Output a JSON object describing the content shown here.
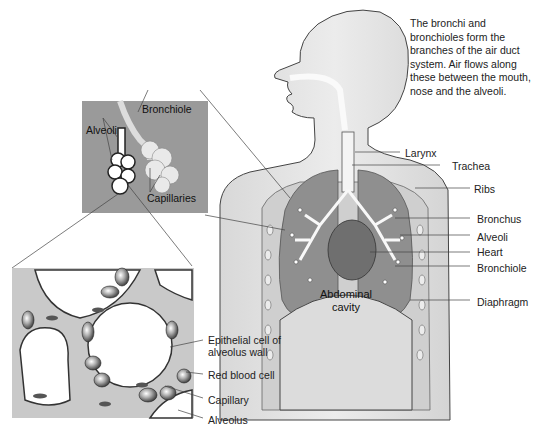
{
  "description": "The bronchi and bronchioles form the branches of the air duct system. Air flows along these between the mouth, nose and the alveoli.",
  "body_labels": {
    "larynx": "Larynx",
    "trachea": "Trachea",
    "ribs": "Ribs",
    "bronchus": "Bronchus",
    "alveoli": "Alveoli",
    "heart": "Heart",
    "bronchiole": "Bronchiole",
    "diaphragm": "Diaphragm",
    "abdominal_line1": "Abdominal",
    "abdominal_line2": "cavity"
  },
  "inset_labels": {
    "bronchiole": "Bronchiole",
    "alveoli": "Alveoli",
    "capillaries": "Capillaries"
  },
  "detail_labels": {
    "epithelial_line1": "Epithelial cell of",
    "epithelial_line2": "alveolus wall",
    "red_blood_cell": "Red blood cell",
    "capillary": "Capillary",
    "alveolus": "Alveolus"
  },
  "colors": {
    "body_fill": "#e6e6e6",
    "lung_fill": "#8f8f8f",
    "inset_bg": "#9a9a9a",
    "heart_fill": "#6f6f6f",
    "outline": "#444444"
  }
}
